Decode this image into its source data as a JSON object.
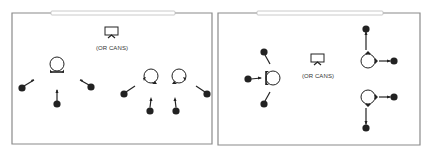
{
  "diagram": {
    "colors": {
      "wall": "#8a8a8a",
      "board": "#bdbdbd",
      "ink": "#222222"
    },
    "panels": [
      {
        "id": "left",
        "av_label": "(OR CANS)",
        "description": "Whiteboard at top, projector/screen, three speaker-circles each with listeners"
      },
      {
        "id": "right",
        "av_label": "(OR CANS)",
        "description": "Whiteboard at top, projector/screen, three speaker-circles each with listeners"
      }
    ]
  }
}
